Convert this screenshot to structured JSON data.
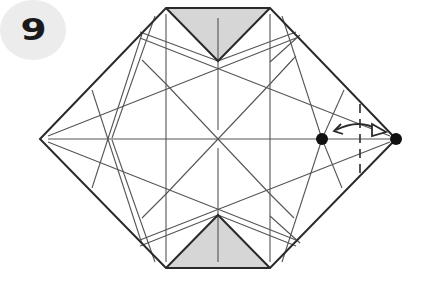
{
  "step": {
    "number": "9"
  },
  "diagram": {
    "colors": {
      "edge": "#2a2a2a",
      "crease": "#555555",
      "shade": "#d6d6d6",
      "badge": "#ececec"
    },
    "annotations": {
      "arrow": "fold-and-unfold",
      "dots": 2,
      "dashed_line": "valley fold guide"
    }
  }
}
